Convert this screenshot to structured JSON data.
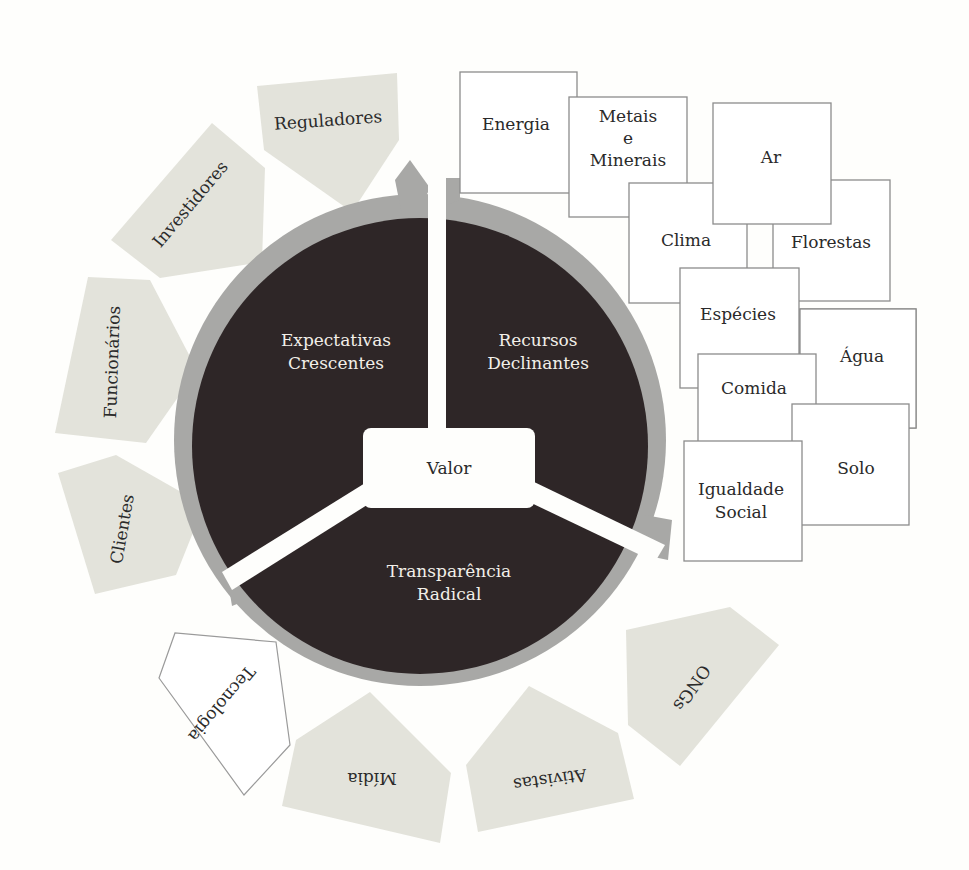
{
  "diagram": {
    "colors": {
      "background": "#fefefc",
      "core": "#2e2627",
      "ring": "#a8a8a6",
      "stakeholder_fill": "#e3e3db",
      "resource_fill": "#ffffff",
      "resource_border": "#8c8c8c",
      "divider": "#fefefc"
    },
    "center": {
      "label": "Valor"
    },
    "segments": [
      {
        "line1": "Expectativas",
        "line2": "Crescentes"
      },
      {
        "line1": "Recursos",
        "line2": "Declinantes"
      },
      {
        "line1": "Transparência",
        "line2": "Radical"
      }
    ],
    "stakeholders": [
      {
        "label": "Reguladores"
      },
      {
        "label": "Investidores"
      },
      {
        "label": "Funcionários"
      },
      {
        "label": "Clientes"
      },
      {
        "label": "Tecnologia"
      },
      {
        "label": "Mídia"
      },
      {
        "label": "Ativistas"
      },
      {
        "label": "ONGs"
      }
    ],
    "resources": [
      {
        "lines": [
          "Energia"
        ]
      },
      {
        "lines": [
          "Metais",
          "e",
          "Minerais"
        ]
      },
      {
        "lines": [
          "Ar"
        ]
      },
      {
        "lines": [
          "Clima"
        ]
      },
      {
        "lines": [
          "Florestas"
        ]
      },
      {
        "lines": [
          "Espécies"
        ]
      },
      {
        "lines": [
          "Água"
        ]
      },
      {
        "lines": [
          "Comida"
        ]
      },
      {
        "lines": [
          "Solo"
        ]
      },
      {
        "lines": [
          "Igualdade",
          "Social"
        ]
      }
    ]
  }
}
